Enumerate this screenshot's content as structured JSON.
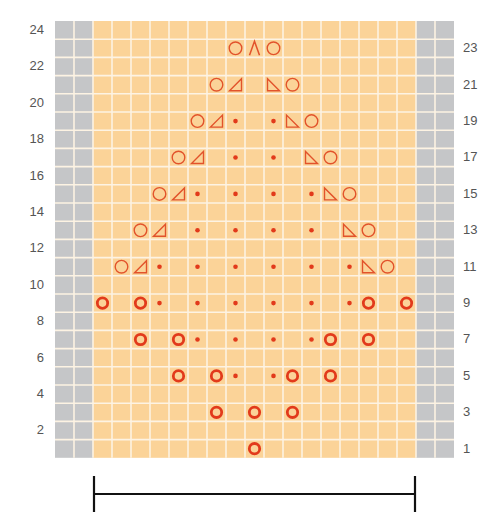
{
  "chart": {
    "type": "knitting-chart",
    "rows": 24,
    "stitch_columns": 17,
    "edge_columns_each_side": 2,
    "left_row_labels": [
      "24",
      "22",
      "20",
      "18",
      "16",
      "14",
      "12",
      "10",
      "8",
      "6",
      "4",
      "2"
    ],
    "right_row_labels": [
      "23",
      "21",
      "19",
      "17",
      "15",
      "13",
      "11",
      "9",
      "7",
      "5",
      "3",
      "1"
    ],
    "colors": {
      "pattern_cell": "#fbd398",
      "edge_cell": "#c5c6c8",
      "grid_line": "#fdf3e3",
      "symbol": "#e2532b",
      "bold_yo": "#e23a1b",
      "label": "#555555",
      "bracket": "#111111"
    },
    "symbol_legend": {
      "yo": "thin circle (yarn over)",
      "yo_bold": "bold circle (yarn over)",
      "dot": "small dot (purl)",
      "k2tog": "right-leaning triangle",
      "ssk": "left-leaning triangle",
      "cdd": "caret (central double decrease)"
    },
    "symbols": [
      {
        "row": 1,
        "cells": [
          [
            8,
            "yo_bold"
          ]
        ]
      },
      {
        "row": 3,
        "cells": [
          [
            6,
            "yo_bold"
          ],
          [
            8,
            "yo_bold"
          ],
          [
            10,
            "yo_bold"
          ]
        ]
      },
      {
        "row": 5,
        "cells": [
          [
            4,
            "yo_bold"
          ],
          [
            6,
            "yo_bold"
          ],
          [
            7,
            "dot"
          ],
          [
            9,
            "dot"
          ],
          [
            10,
            "yo_bold"
          ],
          [
            12,
            "yo_bold"
          ]
        ]
      },
      {
        "row": 7,
        "cells": [
          [
            2,
            "yo_bold"
          ],
          [
            4,
            "yo_bold"
          ],
          [
            5,
            "dot"
          ],
          [
            7,
            "dot"
          ],
          [
            9,
            "dot"
          ],
          [
            11,
            "dot"
          ],
          [
            12,
            "yo_bold"
          ],
          [
            14,
            "yo_bold"
          ]
        ]
      },
      {
        "row": 9,
        "cells": [
          [
            0,
            "yo_bold"
          ],
          [
            2,
            "yo_bold"
          ],
          [
            3,
            "dot"
          ],
          [
            5,
            "dot"
          ],
          [
            7,
            "dot"
          ],
          [
            9,
            "dot"
          ],
          [
            11,
            "dot"
          ],
          [
            13,
            "dot"
          ],
          [
            14,
            "yo_bold"
          ],
          [
            16,
            "yo_bold"
          ]
        ]
      },
      {
        "row": 11,
        "cells": [
          [
            1,
            "yo"
          ],
          [
            2,
            "k2tog"
          ],
          [
            3,
            "dot"
          ],
          [
            5,
            "dot"
          ],
          [
            7,
            "dot"
          ],
          [
            9,
            "dot"
          ],
          [
            11,
            "dot"
          ],
          [
            13,
            "dot"
          ],
          [
            14,
            "ssk"
          ],
          [
            15,
            "yo"
          ]
        ]
      },
      {
        "row": 13,
        "cells": [
          [
            2,
            "yo"
          ],
          [
            3,
            "k2tog"
          ],
          [
            5,
            "dot"
          ],
          [
            7,
            "dot"
          ],
          [
            9,
            "dot"
          ],
          [
            11,
            "dot"
          ],
          [
            13,
            "ssk"
          ],
          [
            14,
            "yo"
          ]
        ]
      },
      {
        "row": 15,
        "cells": [
          [
            3,
            "yo"
          ],
          [
            4,
            "k2tog"
          ],
          [
            5,
            "dot"
          ],
          [
            7,
            "dot"
          ],
          [
            9,
            "dot"
          ],
          [
            11,
            "dot"
          ],
          [
            12,
            "ssk"
          ],
          [
            13,
            "yo"
          ]
        ]
      },
      {
        "row": 17,
        "cells": [
          [
            4,
            "yo"
          ],
          [
            5,
            "k2tog"
          ],
          [
            7,
            "dot"
          ],
          [
            9,
            "dot"
          ],
          [
            11,
            "ssk"
          ],
          [
            12,
            "yo"
          ]
        ]
      },
      {
        "row": 19,
        "cells": [
          [
            5,
            "yo"
          ],
          [
            6,
            "k2tog"
          ],
          [
            7,
            "dot"
          ],
          [
            9,
            "dot"
          ],
          [
            10,
            "ssk"
          ],
          [
            11,
            "yo"
          ]
        ]
      },
      {
        "row": 21,
        "cells": [
          [
            6,
            "yo"
          ],
          [
            7,
            "k2tog"
          ],
          [
            9,
            "ssk"
          ],
          [
            10,
            "yo"
          ]
        ]
      },
      {
        "row": 23,
        "cells": [
          [
            7,
            "yo"
          ],
          [
            8,
            "cdd"
          ],
          [
            9,
            "yo"
          ]
        ]
      }
    ],
    "repeat_bracket": {
      "from_column": 0,
      "to_column": 17
    }
  }
}
